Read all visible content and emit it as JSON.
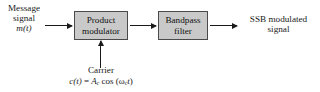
{
  "diagram": {
    "background_color": "#ffffff",
    "block_fill_color": "#c9c9c9",
    "line_color": "#1a1a1a",
    "input": {
      "line1": "Message",
      "line2": "signal",
      "line3": "m(t)"
    },
    "blocks": [
      {
        "name": "product-modulator",
        "line1": "Product",
        "line2": "modulator"
      },
      {
        "name": "bandpass-filter",
        "line1": "Bandpass",
        "line2": "filter"
      }
    ],
    "carrier": {
      "label": "Carrier",
      "equation_lhs": "c(t)",
      "equation_eq": " = ",
      "equation_amplitude": "A",
      "equation_amplitude_sub": "c",
      "equation_cos": " cos (",
      "equation_omega": "ω",
      "equation_omega_sub": "c",
      "equation_time": "t",
      "equation_close": ")"
    },
    "output": {
      "line1": "SSB modulated",
      "line2": "signal"
    },
    "arrows": [
      {
        "name": "input-arrow",
        "direction": "right"
      },
      {
        "name": "interstage-arrow",
        "direction": "right"
      },
      {
        "name": "output-arrow",
        "direction": "right"
      },
      {
        "name": "carrier-arrow",
        "direction": "up"
      }
    ]
  }
}
